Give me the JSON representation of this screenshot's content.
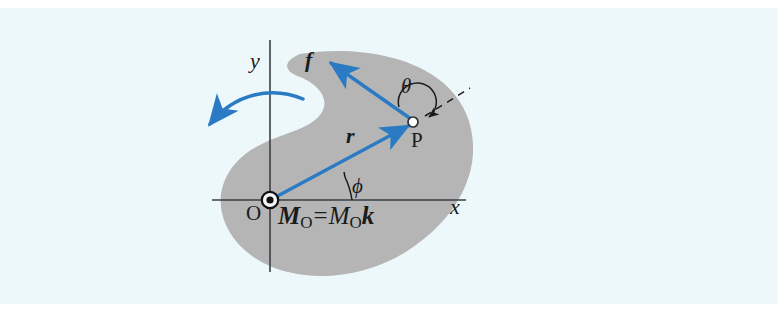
{
  "figure": {
    "kind": "mechanics-moment-diagram",
    "background_color": "#eaf7fa",
    "page_color": "#ffffff",
    "body_fill_color": "#b5b5b5",
    "vector_color": "#2b7bc4",
    "line_color": "#3a3f43",
    "text_color": "#1b1b1b"
  },
  "axes": {
    "y_label": "y",
    "x_label": "x",
    "origin_label": "O"
  },
  "points": {
    "application_point_label": "P"
  },
  "vectors": {
    "force_label": "f",
    "position_label": "r"
  },
  "angles": {
    "theta_label": "θ",
    "phi_label": "ϕ"
  },
  "moment_equation": {
    "moment_vector_symbol": "M",
    "moment_vector_subscript": "O",
    "equals": "=",
    "moment_magnitude_symbol": "M",
    "moment_magnitude_subscript": "O",
    "unit_vector_symbol": "k",
    "plain_text": "M_O = M_O k"
  },
  "rotation_arrow": {
    "name": "counterclockwise-moment-arrow",
    "direction": "counterclockwise"
  },
  "dashed_line": {
    "name": "position-vector-extension",
    "style": "dashed"
  }
}
